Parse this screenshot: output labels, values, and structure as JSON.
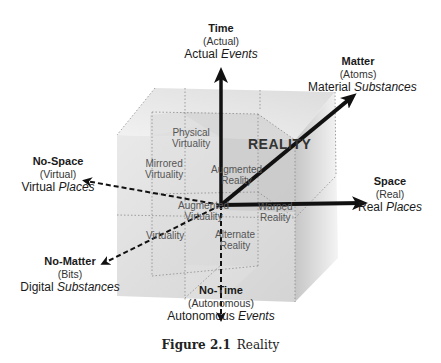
{
  "axes": {
    "time": {
      "title": "Time",
      "sub": "(Actual)",
      "desc_plain": "Actual ",
      "desc_italic": "Events"
    },
    "no_time": {
      "title": "No-Time",
      "sub": "(Autonomous)",
      "desc_plain": "Autonomous ",
      "desc_italic": "Events"
    },
    "matter": {
      "title": "Matter",
      "sub": "(Atoms)",
      "desc_plain": "Material ",
      "desc_italic": "Substances"
    },
    "no_matter": {
      "title": "No-Matter",
      "sub": "(Bits)",
      "desc_plain": "Digital ",
      "desc_italic": "Substances"
    },
    "space": {
      "title": "Space",
      "sub": "(Real)",
      "desc_plain": "Real ",
      "desc_italic": "Places"
    },
    "no_space": {
      "title": "No-Space",
      "sub": "(Virtual)",
      "desc_plain": "Virtual ",
      "desc_italic": "Places"
    }
  },
  "cube": {
    "main_label": "REALITY",
    "cells": {
      "physical_virtuality": [
        "Physical",
        "Virtuality"
      ],
      "mirrored_virtuality": [
        "Mirrored",
        "Virtuality"
      ],
      "augmented_reality": [
        "Augmented",
        "Reality"
      ],
      "augmented_virtuality": [
        "Augmented",
        "Virtuality"
      ],
      "warped_reality": [
        "Warped",
        "Reality"
      ],
      "virtuality": [
        "Virtuality"
      ],
      "alternate_reality": [
        "Alternate",
        "Reality"
      ]
    }
  },
  "caption": {
    "number": "Figure 2.1",
    "title": "Reality"
  },
  "colors": {
    "arrow": "#1a1a1a",
    "cube_light": "#e6e6e6",
    "cube_mid": "#d2d2d2",
    "cube_dark": "#bdbdbd"
  }
}
